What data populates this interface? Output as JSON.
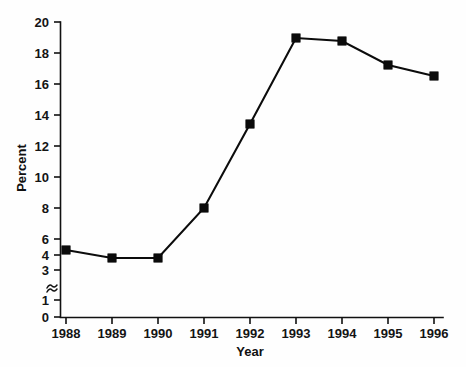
{
  "chart_data": {
    "type": "line",
    "title": "",
    "xlabel": "Year",
    "ylabel": "Percent",
    "categories": [
      "1988",
      "1989",
      "1990",
      "1991",
      "1992",
      "1993",
      "1994",
      "1995",
      "1996"
    ],
    "x": [
      1988,
      1989,
      1990,
      1991,
      1992,
      1993,
      1994,
      1995,
      1996
    ],
    "values": [
      4.3,
      3.8,
      3.8,
      7.2,
      13.0,
      18.9,
      18.7,
      17.0,
      16.3
    ],
    "series": [
      {
        "name": "Percent",
        "values": [
          4.3,
          3.8,
          3.8,
          7.2,
          13.0,
          18.9,
          18.7,
          17.0,
          16.3
        ]
      }
    ],
    "ylim": [
      0,
      20
    ],
    "y_tick_labels": [
      "0",
      "1",
      "3",
      "4",
      "6",
      "8",
      "10",
      "12",
      "14",
      "16",
      "18",
      "20"
    ],
    "y_axis_break": true,
    "y_axis_break_between": [
      1,
      3
    ],
    "x_tick_labels": [
      "1988",
      "1989",
      "1990",
      "1991",
      "1992",
      "1993",
      "1994",
      "1995",
      "1996"
    ],
    "grid": false,
    "legend": "none",
    "marker": "square",
    "line_color": "#0b0b0b",
    "marker_color": "#0b0b0b",
    "background_color": "#fefefe"
  },
  "axes": {
    "y_label": "Percent",
    "x_label": "Year",
    "y_ticks": [
      {
        "label": "20",
        "y": 22
      },
      {
        "label": "18",
        "y": 53
      },
      {
        "label": "16",
        "y": 84
      },
      {
        "label": "14",
        "y": 115
      },
      {
        "label": "12",
        "y": 146
      },
      {
        "label": "10",
        "y": 177
      },
      {
        "label": "8",
        "y": 208
      },
      {
        "label": "6",
        "y": 239
      },
      {
        "label": "4",
        "y": 255
      },
      {
        "label": "3",
        "y": 270
      },
      {
        "label": "1",
        "y": 300
      },
      {
        "label": "0",
        "y": 317
      }
    ],
    "x_ticks": [
      {
        "label": "1988",
        "x": 66
      },
      {
        "label": "1989",
        "x": 112
      },
      {
        "label": "1990",
        "x": 158
      },
      {
        "label": "1991",
        "x": 204
      },
      {
        "label": "1992",
        "x": 250
      },
      {
        "label": "1993",
        "x": 296
      },
      {
        "label": "1994",
        "x": 342
      },
      {
        "label": "1995",
        "x": 388
      },
      {
        "label": "1996",
        "x": 434
      }
    ]
  },
  "points": [
    {
      "label": "1988",
      "value": "4.3",
      "x": 66,
      "y": 250
    },
    {
      "label": "1989",
      "value": "3.8",
      "x": 112,
      "y": 258
    },
    {
      "label": "1990",
      "value": "3.8",
      "x": 158,
      "y": 258
    },
    {
      "label": "1991",
      "value": "7.2",
      "x": 204,
      "y": 208
    },
    {
      "label": "1992",
      "value": "13.0",
      "x": 250,
      "y": 124
    },
    {
      "label": "1993",
      "value": "18.9",
      "x": 296,
      "y": 38
    },
    {
      "label": "1994",
      "value": "18.7",
      "x": 342,
      "y": 41
    },
    {
      "label": "1995",
      "value": "17.0",
      "x": 388,
      "y": 65
    },
    {
      "label": "1996",
      "value": "16.3",
      "x": 434,
      "y": 76
    }
  ]
}
